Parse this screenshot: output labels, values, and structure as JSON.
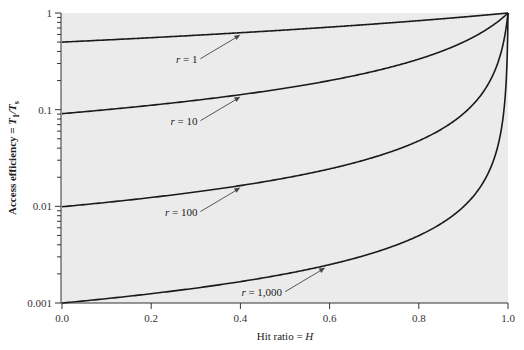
{
  "chart_data": {
    "type": "line",
    "title": "",
    "xlabel": "Hit ratio = H",
    "xlabel_var": "H",
    "xlabel_prefix": "Hit ratio = ",
    "ylabel_prefix": "Access efficiency = ",
    "ylabel_var": "T",
    "ylabel_sub1": "1",
    "ylabel_sep": "/T",
    "ylabel_sub2": "s",
    "xlim": [
      0.0,
      1.0
    ],
    "ylim": [
      0.001,
      1
    ],
    "yscale": "log",
    "xticks": [
      0.0,
      0.2,
      0.4,
      0.6,
      0.8,
      1.0
    ],
    "xtick_labels": [
      "0.0",
      "0.2",
      "0.4",
      "0.6",
      "0.8",
      "1.0"
    ],
    "yticks": [
      1,
      0.1,
      0.01,
      0.001
    ],
    "ytick_labels": [
      "1",
      "0.1",
      "0.01",
      "0.001"
    ],
    "grid": false,
    "formula": "1 / (1 + r(1 - H))",
    "series": [
      {
        "name": "r = 1",
        "r": 1,
        "values_sample": {
          "H": [
            0,
            0.2,
            0.4,
            0.6,
            0.8,
            1.0
          ],
          "y": [
            0.5,
            0.556,
            0.625,
            0.714,
            0.833,
            1.0
          ]
        },
        "annotation": {
          "var": "r",
          "text": " = 1",
          "arrow_H": 0.4
        }
      },
      {
        "name": "r = 10",
        "r": 10,
        "values_sample": {
          "H": [
            0,
            0.2,
            0.4,
            0.6,
            0.8,
            1.0
          ],
          "y": [
            0.0909,
            0.111,
            0.143,
            0.2,
            0.333,
            1.0
          ]
        },
        "annotation": {
          "var": "r",
          "text": " = 10",
          "arrow_H": 0.4
        }
      },
      {
        "name": "r = 100",
        "r": 100,
        "values_sample": {
          "H": [
            0,
            0.2,
            0.4,
            0.6,
            0.8,
            1.0
          ],
          "y": [
            0.0099,
            0.0123,
            0.0164,
            0.0244,
            0.0476,
            1.0
          ]
        },
        "annotation": {
          "var": "r",
          "text": " = 100",
          "arrow_H": 0.4
        }
      },
      {
        "name": "r = 1,000",
        "r": 1000,
        "values_sample": {
          "H": [
            0,
            0.2,
            0.4,
            0.6,
            0.8,
            1.0
          ],
          "y": [
            0.000999,
            0.00125,
            0.00166,
            0.0025,
            0.00498,
            1.0
          ]
        },
        "annotation": {
          "var": "r",
          "text": " = 1,000",
          "arrow_H": 0.59
        }
      }
    ]
  },
  "colors": {
    "plot_bg": "#ebebeb",
    "line": "#1a1a1a",
    "arrow": "#444444"
  }
}
